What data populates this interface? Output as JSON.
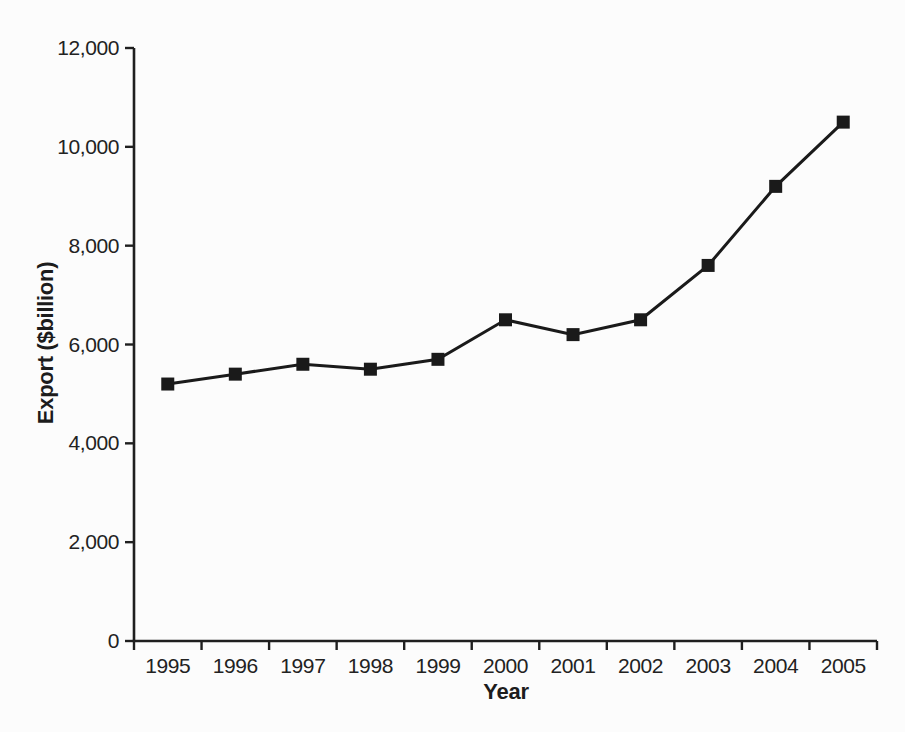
{
  "figure": {
    "background": "#fcfcfc",
    "ink_color": "#1f1f1f"
  },
  "chart_data": {
    "type": "line",
    "xlabel": "Year",
    "ylabel": "Export ($billion)",
    "categories": [
      "1995",
      "1996",
      "1997",
      "1998",
      "1999",
      "2000",
      "2001",
      "2002",
      "2003",
      "2004",
      "2005"
    ],
    "series": [
      {
        "name": "Export",
        "values": [
          5200,
          5400,
          5600,
          5500,
          5700,
          6500,
          6200,
          6500,
          7600,
          9200,
          10500
        ],
        "marker": "square",
        "color": "#1a1a1a"
      }
    ],
    "ylim": [
      0,
      12000
    ],
    "ytick_interval": 2000,
    "yticks": [
      0,
      2000,
      4000,
      6000,
      8000,
      10000,
      12000
    ],
    "ytick_labels": [
      "0",
      "2,000",
      "4,000",
      "6,000",
      "8,000",
      "10,000",
      "12,000"
    ],
    "grid": false,
    "legend": "none"
  }
}
